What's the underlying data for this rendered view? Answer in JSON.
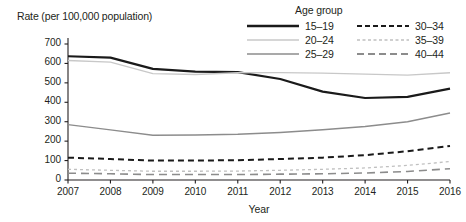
{
  "chart_data": {
    "type": "line",
    "title": "",
    "ylabel": "Rate (per 100,000 population)",
    "xlabel": "Year",
    "legend_title": "Age group",
    "legend_position": "top-right",
    "grid": false,
    "x": [
      2007,
      2008,
      2009,
      2010,
      2011,
      2012,
      2013,
      2014,
      2015,
      2016
    ],
    "xticklabels": [
      "2007",
      "2008",
      "2009",
      "2010",
      "2011",
      "2012",
      "2013",
      "2014",
      "2015",
      "2016"
    ],
    "yticklabels": [
      "0",
      "100",
      "200",
      "300",
      "400",
      "500",
      "600",
      "700"
    ],
    "ylim": [
      0,
      700
    ],
    "ytick_step": 100,
    "series": [
      {
        "name": "15–19",
        "color": "#1a1a1a",
        "width": 2.2,
        "dash": "none",
        "values": [
          637,
          630,
          572,
          558,
          555,
          520,
          455,
          422,
          428,
          470
        ]
      },
      {
        "name": "20–24",
        "color": "#c8c8c8",
        "width": 1.3,
        "dash": "none",
        "values": [
          615,
          607,
          548,
          543,
          552,
          553,
          550,
          545,
          540,
          552
        ]
      },
      {
        "name": "25–29",
        "color": "#8c8c8c",
        "width": 1.5,
        "dash": "none",
        "values": [
          285,
          258,
          230,
          232,
          235,
          245,
          258,
          275,
          300,
          345
        ]
      },
      {
        "name": "30–34",
        "color": "#1a1a1a",
        "width": 2.0,
        "dash": "6,4",
        "values": [
          115,
          108,
          100,
          100,
          102,
          108,
          115,
          128,
          148,
          175
        ]
      },
      {
        "name": "35–39",
        "color": "#c0c0c0",
        "width": 1.3,
        "dash": "3,3",
        "values": [
          55,
          50,
          45,
          45,
          46,
          50,
          55,
          62,
          75,
          95
        ]
      },
      {
        "name": "40–44",
        "color": "#8c8c8c",
        "width": 1.6,
        "dash": "8,5",
        "values": [
          35,
          32,
          28,
          28,
          28,
          30,
          32,
          36,
          44,
          58
        ]
      }
    ]
  }
}
